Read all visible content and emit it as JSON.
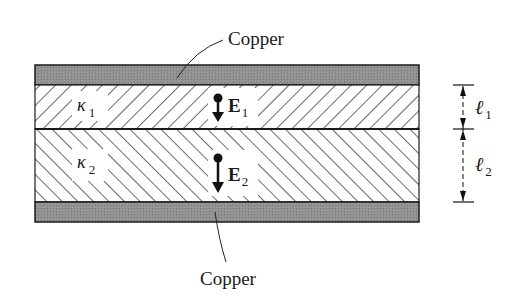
{
  "labels": {
    "top_copper": "Copper",
    "bottom_copper": "Copper",
    "kappa1_symbol": "κ",
    "kappa1_sub": "1",
    "kappa2_symbol": "κ",
    "kappa2_sub": "2",
    "e1_symbol": "E",
    "e1_sub": "1",
    "e2_symbol": "E",
    "e2_sub": "2",
    "l1_symbol": "ℓ",
    "l1_sub": "1",
    "l2_symbol": "ℓ",
    "l2_sub": "2"
  },
  "colors": {
    "copper_fill": "#8f8f8f",
    "outline": "#1a1a1a",
    "hatch": "#2a2a2a",
    "background": "#ffffff"
  },
  "layers": [
    {
      "name": "copper-top",
      "material": "Copper"
    },
    {
      "name": "dielectric-1",
      "constant": "κ1",
      "field": "E1",
      "thickness": "ℓ1"
    },
    {
      "name": "dielectric-2",
      "constant": "κ2",
      "field": "E2",
      "thickness": "ℓ2"
    },
    {
      "name": "copper-bottom",
      "material": "Copper"
    }
  ]
}
